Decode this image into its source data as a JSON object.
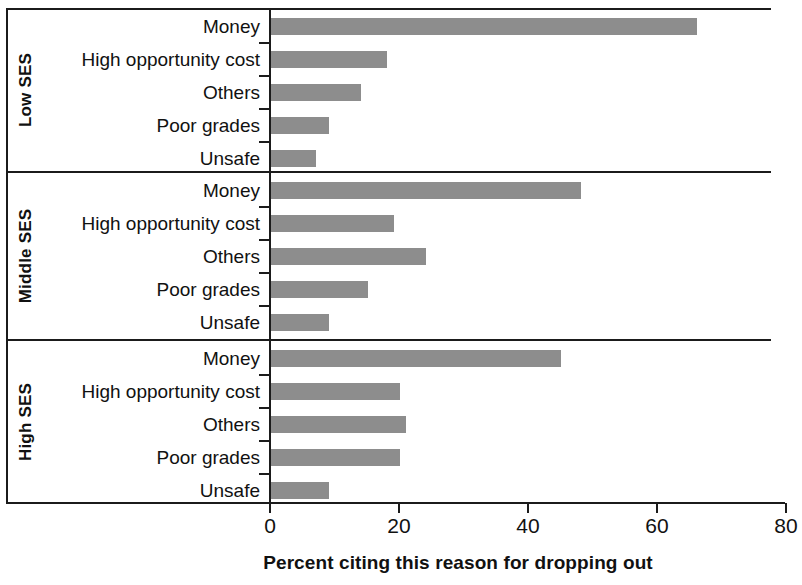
{
  "chart_data": {
    "type": "bar",
    "orientation": "horizontal",
    "title": "",
    "xlabel": "Percent citing this reason for dropping out",
    "ylabel": "",
    "xlim": [
      0,
      80
    ],
    "xticks": [
      0,
      20,
      40,
      60,
      80
    ],
    "grid": false,
    "legend": "none",
    "bar_color": "#8d8d8d",
    "axis_color": "#1b1b1b",
    "groups": [
      {
        "name": "Low SES",
        "categories": [
          "Money",
          "High opportunity cost",
          "Others",
          "Poor grades",
          "Unsafe"
        ],
        "values": [
          66,
          18,
          14,
          9,
          7
        ]
      },
      {
        "name": "Middle SES",
        "categories": [
          "Money",
          "High opportunity cost",
          "Others",
          "Poor grades",
          "Unsafe"
        ],
        "values": [
          48,
          19,
          24,
          15,
          9
        ]
      },
      {
        "name": "High SES",
        "categories": [
          "Money",
          "High opportunity cost",
          "Others",
          "Poor grades",
          "Unsafe"
        ],
        "values": [
          45,
          20,
          21,
          20,
          9
        ]
      }
    ]
  },
  "axis": {
    "x_title": "Percent citing this reason for dropping out",
    "tick_labels": [
      "0",
      "20",
      "40",
      "60",
      "80"
    ]
  },
  "groups": {
    "low": {
      "name": "Low SES",
      "rows": [
        {
          "label": "Money",
          "value": 66
        },
        {
          "label": "High opportunity cost",
          "value": 18
        },
        {
          "label": "Others",
          "value": 14
        },
        {
          "label": "Poor grades",
          "value": 9
        },
        {
          "label": "Unsafe",
          "value": 7
        }
      ]
    },
    "middle": {
      "name": "Middle SES",
      "rows": [
        {
          "label": "Money",
          "value": 48
        },
        {
          "label": "High opportunity cost",
          "value": 19
        },
        {
          "label": "Others",
          "value": 24
        },
        {
          "label": "Poor grades",
          "value": 15
        },
        {
          "label": "Unsafe",
          "value": 9
        }
      ]
    },
    "high": {
      "name": "High SES",
      "rows": [
        {
          "label": "Money",
          "value": 45
        },
        {
          "label": "High opportunity cost",
          "value": 20
        },
        {
          "label": "Others",
          "value": 21
        },
        {
          "label": "Poor grades",
          "value": 20
        },
        {
          "label": "Unsafe",
          "value": 9
        }
      ]
    }
  }
}
